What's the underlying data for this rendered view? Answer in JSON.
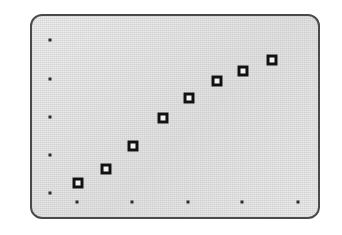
{
  "figure": {
    "kind": "scatter-plot-panel",
    "panel": {
      "x": 30,
      "y": 14,
      "width": 290,
      "height": 205,
      "corner_radius": 12,
      "fill_color": "#e8e8e8",
      "border_color": "#4a4a4a",
      "border_width": 2
    },
    "background_color": "#ffffff",
    "marker_color": "#111111",
    "marker_fill_color": "#f2f2f2",
    "tick_color": "#2b2b2b"
  },
  "chart_data": {
    "type": "scatter",
    "title": "",
    "subtitle": "",
    "xlabel": "",
    "ylabel": "",
    "grid": false,
    "legend": null,
    "annotations": [],
    "xlim": [
      0,
      10
    ],
    "ylim": [
      0,
      10
    ],
    "xticks": [
      1,
      3,
      5,
      7,
      9
    ],
    "yticks": [
      1,
      3,
      5,
      7,
      9
    ],
    "xticklabels": [
      "",
      "",
      "",
      "",
      ""
    ],
    "yticklabels": [
      "",
      "",
      "",
      "",
      ""
    ],
    "marker": "square-open",
    "points": [
      {
        "x": 1.0,
        "y": 1.1
      },
      {
        "x": 2.1,
        "y": 2.0
      },
      {
        "x": 3.1,
        "y": 3.2
      },
      {
        "x": 4.2,
        "y": 5.0
      },
      {
        "x": 5.2,
        "y": 6.2
      },
      {
        "x": 6.3,
        "y": 7.3
      },
      {
        "x": 7.3,
        "y": 8.0
      },
      {
        "x": 8.4,
        "y": 8.8
      }
    ],
    "pixel_points": [
      {
        "cx": 78,
        "cy": 183
      },
      {
        "cx": 106,
        "cy": 169
      },
      {
        "cx": 133,
        "cy": 146
      },
      {
        "cx": 163,
        "cy": 118
      },
      {
        "cx": 189,
        "cy": 98
      },
      {
        "cx": 217,
        "cy": 81
      },
      {
        "cx": 243,
        "cy": 71
      },
      {
        "cx": 272,
        "cy": 60
      }
    ],
    "pixel_xticks": [
      {
        "cx": 77,
        "cy": 202
      },
      {
        "cx": 132,
        "cy": 202
      },
      {
        "cx": 188,
        "cy": 202
      },
      {
        "cx": 242,
        "cy": 202
      },
      {
        "cx": 298,
        "cy": 202
      }
    ],
    "pixel_yticks": [
      {
        "cx": 50,
        "cy": 40
      },
      {
        "cx": 50,
        "cy": 79
      },
      {
        "cx": 50,
        "cy": 117
      },
      {
        "cx": 50,
        "cy": 155
      },
      {
        "cx": 50,
        "cy": 193
      }
    ]
  }
}
